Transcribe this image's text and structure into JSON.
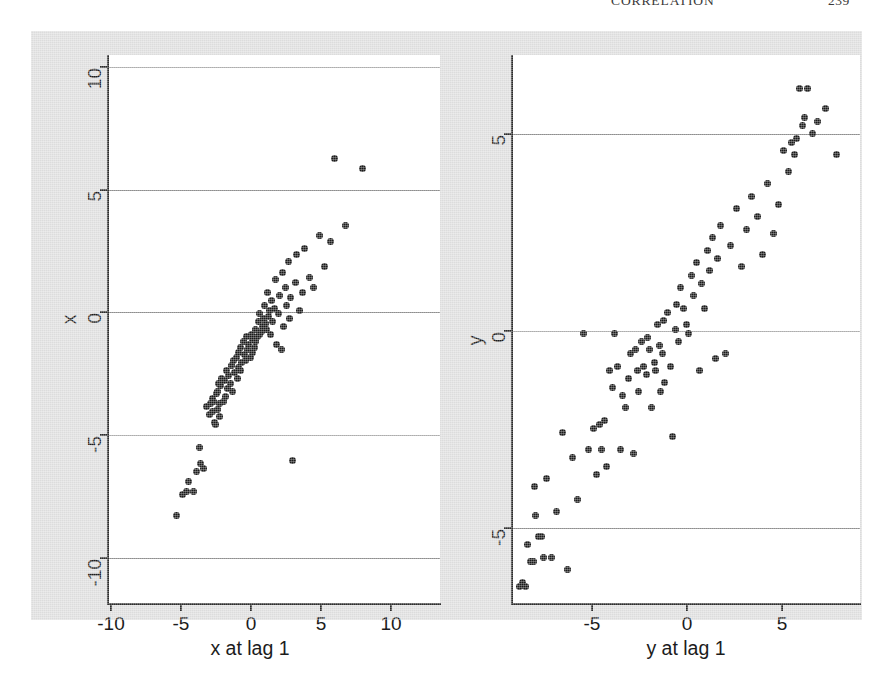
{
  "running_head": {
    "title": "CORRELATION",
    "page": "239"
  },
  "figure": {
    "background_color": "#dcdcdc",
    "panel_background_color": "#ffffff",
    "gridline_color": "#8e8e8e",
    "axis_color": "#2b2b2b",
    "marker_color": "#1a1a1a"
  },
  "chart_data": [
    {
      "type": "scatter",
      "title": "",
      "panel": "left",
      "xlabel": "x at lag 1",
      "ylabel": "x",
      "xlim": [
        -11.8,
        11.8
      ],
      "ylim": [
        -10.6,
        10.6
      ],
      "xticks": [
        -10,
        -5,
        0,
        5,
        10
      ],
      "yticks": [
        -10,
        -5,
        0,
        5,
        10
      ],
      "xticklabels": [
        "-10",
        "-5",
        "0",
        "5",
        "10"
      ],
      "yticklabels": [
        "-10",
        "-5",
        "0",
        "5",
        "10"
      ],
      "grid": "horizontal",
      "legend": "none",
      "n_points": 99,
      "x": [
        -6.9,
        -6.5,
        -6.2,
        -6.1,
        -5.7,
        -5.5,
        -5.3,
        -5.2,
        -5.0,
        -4.8,
        -4.6,
        -4.5,
        -4.4,
        -4.35,
        -4.3,
        -4.2,
        -4.15,
        -4.1,
        -4.05,
        -4.0,
        -3.95,
        -3.9,
        -3.85,
        -3.8,
        -3.7,
        -3.6,
        -3.5,
        -3.45,
        -3.4,
        -3.3,
        -3.2,
        -3.1,
        -3.0,
        -2.95,
        -2.9,
        -2.8,
        -2.7,
        -2.6,
        -2.55,
        -2.5,
        -2.4,
        -2.35,
        -2.3,
        -2.2,
        -2.1,
        -2.0,
        -1.95,
        -1.9,
        -1.8,
        -1.7,
        -1.6,
        -1.55,
        -1.5,
        -1.4,
        -1.35,
        -1.3,
        -1.2,
        -1.1,
        -1.05,
        -1.0,
        -0.9,
        -0.8,
        -0.75,
        -0.7,
        -0.6,
        -0.5,
        -0.45,
        -0.4,
        -0.3,
        -0.25,
        -0.2,
        -0.1,
        0.0,
        0.1,
        0.2,
        0.3,
        0.4,
        0.5,
        0.6,
        0.7,
        0.8,
        0.9,
        1.0,
        1.1,
        1.2,
        1.3,
        1.5,
        1.6,
        1.8,
        2.0,
        2.2,
        2.5,
        2.8,
        3.2,
        3.6,
        4.0,
        4.3,
        5.1,
        6.3
      ],
      "y": [
        -7.2,
        -6.4,
        -6.3,
        -5.9,
        -6.3,
        -5.5,
        -4.6,
        -5.2,
        -5.4,
        -3.0,
        -3.3,
        -2.9,
        -3.2,
        -2.7,
        -2.8,
        -3.6,
        -3.7,
        -2.5,
        -2.4,
        -3.1,
        -2.1,
        -3.4,
        -2.9,
        -2.2,
        -1.9,
        -2.8,
        -2.0,
        -2.6,
        -1.6,
        -2.3,
        -1.8,
        -2.1,
        -1.4,
        -2.4,
        -1.2,
        -1.7,
        -1.1,
        -1.9,
        -0.9,
        -1.5,
        -1.6,
        -0.7,
        -1.3,
        -0.5,
        -1.0,
        -1.2,
        -0.3,
        -0.8,
        -0.6,
        -1.1,
        -0.2,
        -0.9,
        -0.4,
        -0.7,
        0.0,
        -0.5,
        -0.3,
        0.3,
        -0.2,
        0.6,
        -0.1,
        0.1,
        0.4,
        0.9,
        0.2,
        0.0,
        1.4,
        0.5,
        0.7,
        -0.2,
        1.1,
        0.3,
        0.8,
        1.9,
        -0.6,
        0.6,
        1.3,
        -0.8,
        2.2,
        0.1,
        1.6,
        0.9,
        2.6,
        0.4,
        1.2,
        -5.1,
        1.8,
        2.9,
        0.7,
        1.4,
        3.1,
        2.0,
        1.6,
        3.6,
        2.4,
        3.4,
        6.6,
        4.0,
        6.2
      ]
    },
    {
      "type": "scatter",
      "title": "",
      "panel": "right",
      "xlabel": "y at lag 1",
      "ylabel": "y",
      "xlim": [
        -6.6,
        6.6
      ],
      "ylim": [
        -6.6,
        6.6
      ],
      "xticks": [
        -5,
        0,
        5
      ],
      "yticks": [
        -5,
        0,
        5
      ],
      "xticklabels": [
        "-5",
        "0",
        "5"
      ],
      "yticklabels": [
        "-5",
        "0",
        "5"
      ],
      "grid": "horizontal",
      "legend": "none",
      "n_points": 99,
      "x": [
        -6.3,
        -6.2,
        -6.1,
        -6.0,
        -5.9,
        -5.8,
        -5.75,
        -5.7,
        -5.6,
        -5.5,
        -5.4,
        -5.3,
        -5.1,
        -4.9,
        -4.7,
        -4.5,
        -4.3,
        -4.1,
        -3.9,
        -3.7,
        -3.5,
        -3.4,
        -3.3,
        -3.2,
        -3.1,
        -3.0,
        -2.9,
        -2.8,
        -2.7,
        -2.6,
        -2.5,
        -2.4,
        -2.3,
        -2.2,
        -2.1,
        -2.0,
        -1.9,
        -1.85,
        -1.8,
        -1.7,
        -1.6,
        -1.5,
        -1.45,
        -1.4,
        -1.3,
        -1.2,
        -1.15,
        -1.1,
        -1.0,
        -0.95,
        -0.9,
        -0.85,
        -0.8,
        -0.7,
        -0.6,
        -0.5,
        -0.4,
        -0.35,
        -0.3,
        -0.2,
        -0.1,
        0.0,
        0.1,
        0.2,
        0.3,
        0.4,
        0.5,
        0.6,
        0.7,
        0.8,
        0.9,
        1.0,
        1.1,
        1.2,
        1.3,
        1.5,
        1.7,
        1.9,
        2.1,
        2.3,
        2.5,
        2.7,
        2.9,
        3.1,
        3.3,
        3.5,
        3.7,
        3.9,
        4.0,
        4.1,
        4.2,
        4.3,
        4.4,
        4.5,
        4.6,
        4.8,
        5.0,
        5.3,
        5.7
      ],
      "y": [
        -6.2,
        -6.1,
        -6.2,
        -5.2,
        -5.6,
        -5.6,
        -3.8,
        -4.5,
        -5.0,
        -5.0,
        -5.5,
        -3.6,
        -5.5,
        -4.4,
        -2.5,
        -5.8,
        -3.1,
        -4.1,
        -0.1,
        -2.9,
        -2.4,
        -3.5,
        -2.3,
        -2.9,
        -2.2,
        -3.3,
        -1.0,
        -1.4,
        -0.1,
        -0.9,
        -2.9,
        -1.6,
        -1.9,
        -1.2,
        -0.6,
        -3.0,
        -0.5,
        -1.0,
        -1.5,
        -0.3,
        -0.9,
        -1.1,
        -0.2,
        -0.5,
        -1.9,
        -0.8,
        -1.0,
        0.1,
        -0.4,
        -1.5,
        -0.6,
        0.2,
        -1.3,
        0.4,
        -0.9,
        -2.6,
        0.0,
        0.6,
        -0.3,
        1.0,
        0.5,
        0.1,
        -0.1,
        1.3,
        0.8,
        1.6,
        -1.0,
        1.1,
        0.5,
        1.9,
        1.4,
        2.2,
        -0.7,
        1.7,
        2.5,
        -0.6,
        2.0,
        2.9,
        1.5,
        2.4,
        3.2,
        2.7,
        1.8,
        3.5,
        2.3,
        3.0,
        4.3,
        3.8,
        4.5,
        4.2,
        4.6,
        5.8,
        4.9,
        5.1,
        5.8,
        4.7,
        5.0,
        5.3,
        4.2
      ]
    }
  ]
}
